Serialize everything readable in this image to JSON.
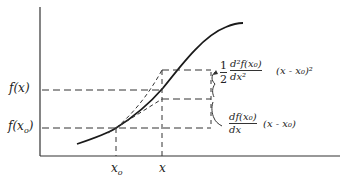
{
  "diagram": {
    "title": "",
    "type": "taylor-series-approximation",
    "axes": {
      "y_axis_labels": [
        "f(x)",
        "f(x0)"
      ],
      "x_axis_labels": [
        "x0",
        "x"
      ]
    },
    "labels": {
      "f_x": "f(x)",
      "f_x0_prefix": "f(x",
      "f_x0_sub": "o",
      "f_x0_suffix": ")",
      "x0_main": "x",
      "x0_sub": "o",
      "x": "x"
    },
    "second_order_term": {
      "coef_num": "1",
      "coef_den": "2",
      "num": "d²f(x₀)",
      "den": "dx²",
      "tail": "(x - x₀)²"
    },
    "first_order_term": {
      "num": "df(x₀)",
      "den": "dx",
      "tail": "(x - x₀)"
    },
    "colors": {
      "line": "#222222",
      "background": "#ffffff"
    }
  }
}
